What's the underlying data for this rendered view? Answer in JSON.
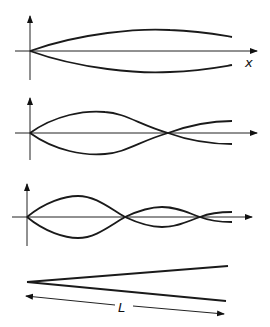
{
  "figure": {
    "panels": [
      {
        "name": "mode-1",
        "axis_label": "x",
        "nodes_after_origin": 0
      },
      {
        "name": "mode-2",
        "axis_label": "",
        "nodes_after_origin": 1
      },
      {
        "name": "mode-3",
        "axis_label": "",
        "nodes_after_origin": 2
      },
      {
        "name": "taper",
        "dimension_label": "L"
      }
    ]
  },
  "labels": {
    "x_axis": "x",
    "length": "L"
  }
}
